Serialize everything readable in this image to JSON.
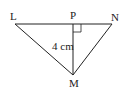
{
  "diagram": {
    "type": "triangle",
    "vertices": [
      {
        "label": "L",
        "x": 15,
        "y": 24
      },
      {
        "label": "N",
        "x": 112,
        "y": 24
      },
      {
        "label": "M",
        "x": 73,
        "y": 75
      }
    ],
    "foot": {
      "label": "P",
      "x": 73,
      "y": 24
    },
    "altitude_label": "4 cm",
    "right_angle_at": "P",
    "stroke_color": "#222222"
  }
}
